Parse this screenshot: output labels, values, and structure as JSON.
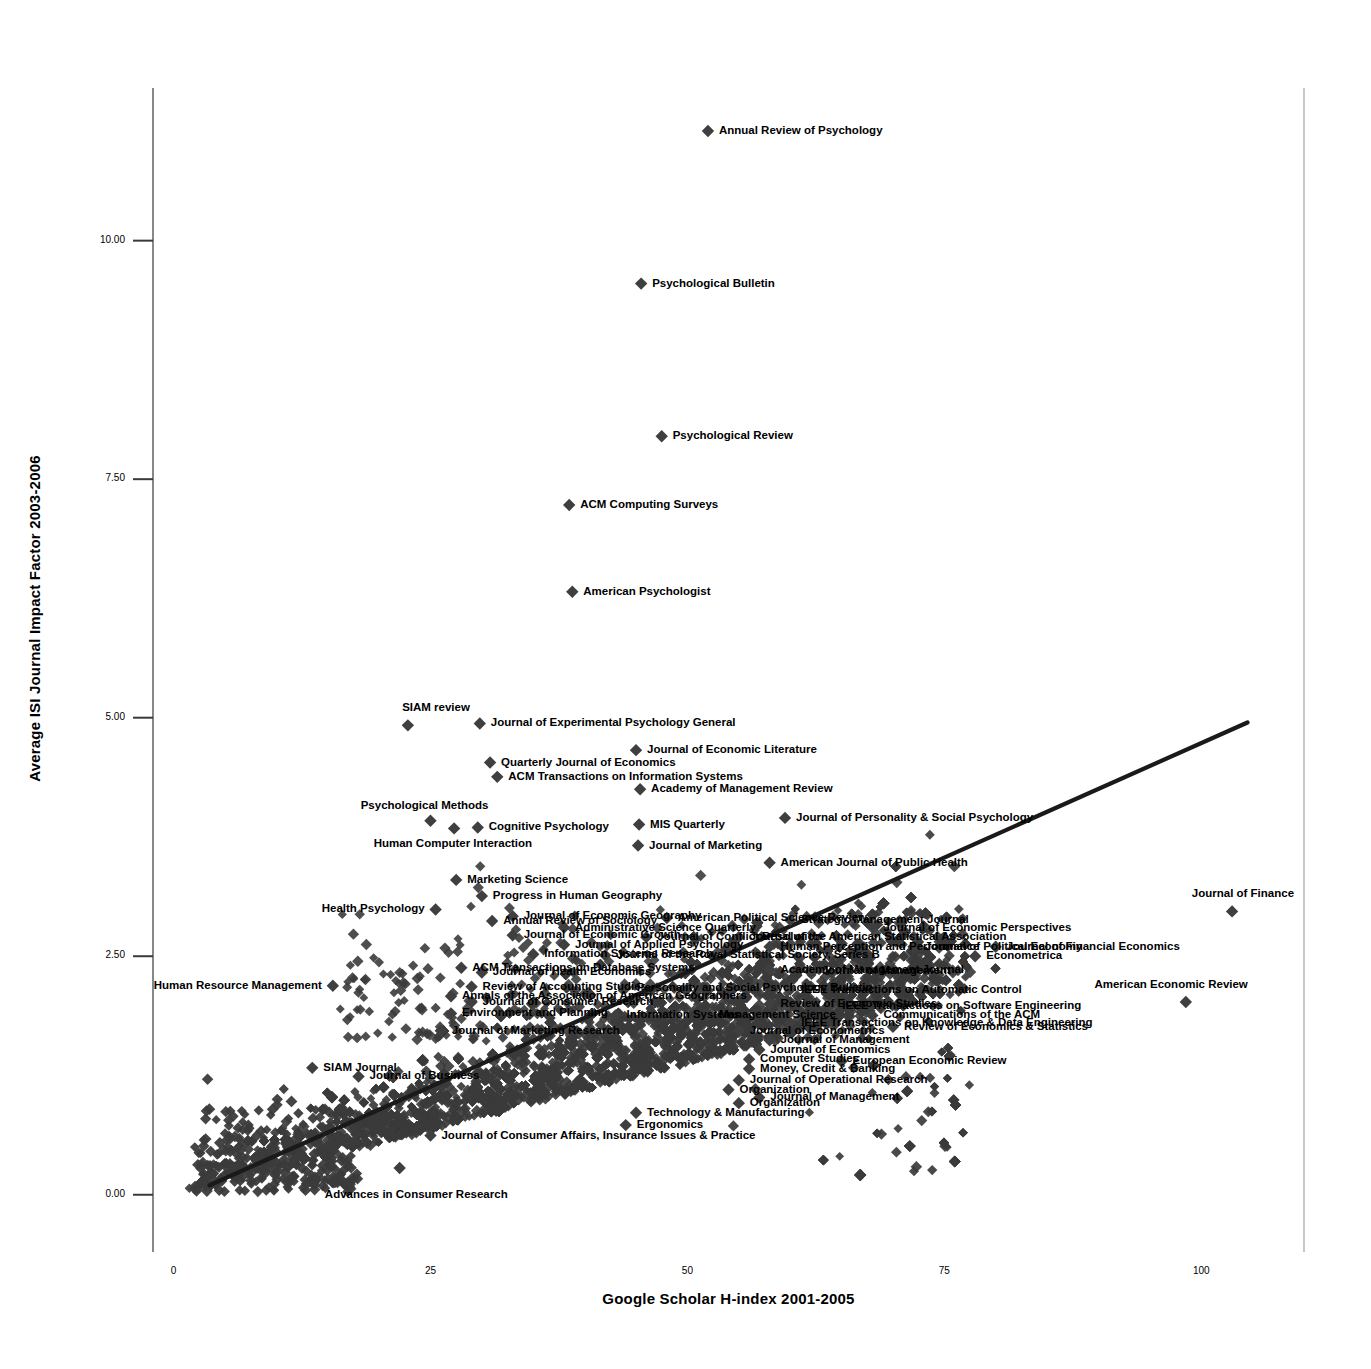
{
  "chart_data": {
    "type": "scatter",
    "title": "",
    "xlabel": "Google Scholar H-index 2001-2005",
    "ylabel": "Average ISI Journal Impact Factor 2003-2006",
    "xlim": [
      -2,
      110
    ],
    "ylim": [
      -0.6,
      11.6
    ],
    "xticks": [
      "0",
      "25",
      "50",
      "75",
      "100"
    ],
    "xtick_values": [
      0,
      25,
      50,
      75,
      100
    ],
    "yticks": [
      "0.00",
      "2.50",
      "5.00",
      "7.50",
      "10.00"
    ],
    "ytick_values": [
      0.0,
      2.5,
      5.0,
      7.5,
      10.0
    ],
    "grid": false,
    "legend": "none",
    "marker": "diamond",
    "marker_color": "#3f3f3f",
    "trendline": {
      "shown": true,
      "color": "#1a1a1a",
      "x_start": 3.5,
      "y_start": 0.1,
      "x_end": 104.5,
      "y_end": 4.95
    },
    "labeled_points": [
      {
        "label": "Annual Review of Psychology",
        "x": 52.0,
        "y": 11.15,
        "pos": "right"
      },
      {
        "label": "Psychological Bulletin",
        "x": 45.5,
        "y": 9.55,
        "pos": "right"
      },
      {
        "label": "Psychological Review",
        "x": 47.5,
        "y": 7.95,
        "pos": "right"
      },
      {
        "label": "ACM Computing Surveys",
        "x": 38.5,
        "y": 7.23,
        "pos": "right"
      },
      {
        "label": "American Psychologist",
        "x": 38.8,
        "y": 6.32,
        "pos": "right"
      },
      {
        "label": "SIAM review",
        "x": 22.8,
        "y": 4.92,
        "pos": "above"
      },
      {
        "label": "Journal of Experimental Psychology General",
        "x": 29.8,
        "y": 4.94,
        "pos": "right"
      },
      {
        "label": "Journal of Economic Literature",
        "x": 45.0,
        "y": 4.66,
        "pos": "right"
      },
      {
        "label": "Quarterly Journal of Economics",
        "x": 30.8,
        "y": 4.53,
        "pos": "right"
      },
      {
        "label": "ACM Transactions on Information Systems",
        "x": 31.5,
        "y": 4.38,
        "pos": "right"
      },
      {
        "label": "Academy of Management Review",
        "x": 45.4,
        "y": 4.25,
        "pos": "right"
      },
      {
        "label": "Psychological Methods",
        "x": 25.0,
        "y": 3.92,
        "pos": "above-left"
      },
      {
        "label": "Journal of Personality & Social Psychology",
        "x": 59.5,
        "y": 3.95,
        "pos": "right"
      },
      {
        "label": "Cognitive Psychology",
        "x": 29.6,
        "y": 3.85,
        "pos": "right"
      },
      {
        "label": "MIS Quarterly",
        "x": 45.3,
        "y": 3.88,
        "pos": "right"
      },
      {
        "label": "Human Computer Interaction",
        "x": 27.3,
        "y": 3.84,
        "pos": "below-left"
      },
      {
        "label": "Journal of Marketing",
        "x": 45.2,
        "y": 3.66,
        "pos": "right"
      },
      {
        "label": "American Journal of Public Health",
        "x": 58.0,
        "y": 3.48,
        "pos": "right"
      },
      {
        "label": "Marketing Science",
        "x": 27.5,
        "y": 3.3,
        "pos": "right"
      },
      {
        "label": "Progress in Human Geography",
        "x": 30.0,
        "y": 3.13,
        "pos": "right"
      },
      {
        "label": "Health Psychology",
        "x": 25.5,
        "y": 2.99,
        "pos": "left"
      },
      {
        "label": "Journal of Finance",
        "x": 103.0,
        "y": 2.97,
        "pos": "above"
      },
      {
        "label": "Journal of Economic Geography",
        "x": 33.0,
        "y": 2.92,
        "pos": "right"
      },
      {
        "label": "Annual Review of Sociology",
        "x": 31.0,
        "y": 2.87,
        "pos": "right"
      },
      {
        "label": "American Political Science Review",
        "x": 48.0,
        "y": 2.9,
        "pos": "right"
      },
      {
        "label": "Strategic Management Journal",
        "x": 60.0,
        "y": 2.88,
        "pos": "right"
      },
      {
        "label": "Administrative Science Quarterly",
        "x": 38.0,
        "y": 2.8,
        "pos": "right"
      },
      {
        "label": "Journal of Economic Perspectives",
        "x": 68.0,
        "y": 2.8,
        "pos": "right"
      },
      {
        "label": "Journal of Economic Growth",
        "x": 33.0,
        "y": 2.72,
        "pos": "right"
      },
      {
        "label": "Journal of Conflict Resolution",
        "x": 46.0,
        "y": 2.7,
        "pos": "right"
      },
      {
        "label": "Journal of the American Statistical Association",
        "x": 55.0,
        "y": 2.7,
        "pos": "right"
      },
      {
        "label": "Journal of Applied Psychology",
        "x": 38.0,
        "y": 2.62,
        "pos": "right"
      },
      {
        "label": "Human Perception and Performance",
        "x": 58.0,
        "y": 2.6,
        "pos": "right"
      },
      {
        "label": "Journal of Political Economy",
        "x": 72.0,
        "y": 2.6,
        "pos": "right"
      },
      {
        "label": "Journal of Financial Economics",
        "x": 80.0,
        "y": 2.6,
        "pos": "right"
      },
      {
        "label": "Journal of the Royal Statistical Society, Series B",
        "x": 42.0,
        "y": 2.51,
        "pos": "right"
      },
      {
        "label": "Information Systems Research",
        "x": 35.0,
        "y": 2.52,
        "pos": "right"
      },
      {
        "label": "Econometrica",
        "x": 78.0,
        "y": 2.5,
        "pos": "right"
      },
      {
        "label": "ACM Transactions on Database Systems",
        "x": 28.0,
        "y": 2.38,
        "pos": "right"
      },
      {
        "label": "Journal of Health Economics",
        "x": 30.0,
        "y": 2.33,
        "pos": "right"
      },
      {
        "label": "Academy of Management Journal",
        "x": 58.0,
        "y": 2.36,
        "pos": "right"
      },
      {
        "label": "Journal of Management",
        "x": 62.0,
        "y": 2.34,
        "pos": "right"
      },
      {
        "label": "Human Resource Management",
        "x": 15.5,
        "y": 2.19,
        "pos": "left"
      },
      {
        "label": "Review of Accounting Studies",
        "x": 29.0,
        "y": 2.18,
        "pos": "right"
      },
      {
        "label": "Personality and Social Psychology Bulletin",
        "x": 44.0,
        "y": 2.17,
        "pos": "right"
      },
      {
        "label": "IEEE Transactions on Automatic Control",
        "x": 60.0,
        "y": 2.15,
        "pos": "right"
      },
      {
        "label": "Annals of the Association of American Geographers",
        "x": 27.0,
        "y": 2.08,
        "pos": "right"
      },
      {
        "label": "American Economic Review",
        "x": 98.5,
        "y": 2.02,
        "pos": "above"
      },
      {
        "label": "Journal of Consumer Research",
        "x": 29.0,
        "y": 2.02,
        "pos": "right"
      },
      {
        "label": "Review of Economic Studies",
        "x": 58.0,
        "y": 2.0,
        "pos": "right"
      },
      {
        "label": "IEEE Transactions on Software Engineering",
        "x": 64.0,
        "y": 1.98,
        "pos": "right"
      },
      {
        "label": "Environment and Planning",
        "x": 27.0,
        "y": 1.9,
        "pos": "right"
      },
      {
        "label": "Information Systems",
        "x": 43.0,
        "y": 1.88,
        "pos": "right"
      },
      {
        "label": "Management Science",
        "x": 52.0,
        "y": 1.88,
        "pos": "right"
      },
      {
        "label": "Communications of the ACM",
        "x": 68.0,
        "y": 1.88,
        "pos": "right"
      },
      {
        "label": "IEEE Transactions on Knowledge & Data Engineering",
        "x": 60.0,
        "y": 1.8,
        "pos": "right"
      },
      {
        "label": "Review of Economics & Statistics",
        "x": 70.0,
        "y": 1.76,
        "pos": "right"
      },
      {
        "label": "Journal of Marketing Research",
        "x": 26.0,
        "y": 1.72,
        "pos": "right"
      },
      {
        "label": "Journal of Econometrics",
        "x": 55.0,
        "y": 1.72,
        "pos": "right"
      },
      {
        "label": "Journal of Management",
        "x": 58.0,
        "y": 1.62,
        "pos": "right"
      },
      {
        "label": "Journal of Economics",
        "x": 57.0,
        "y": 1.52,
        "pos": "right"
      },
      {
        "label": "Computer Studies",
        "x": 56.0,
        "y": 1.42,
        "pos": "right"
      },
      {
        "label": "European Economic Review",
        "x": 65.0,
        "y": 1.4,
        "pos": "right"
      },
      {
        "label": "SIAM Journal",
        "x": 13.5,
        "y": 1.33,
        "pos": "right"
      },
      {
        "label": "Money, Credit & Banking",
        "x": 56.0,
        "y": 1.32,
        "pos": "right"
      },
      {
        "label": "Journal of Business",
        "x": 18.0,
        "y": 1.24,
        "pos": "right"
      },
      {
        "label": "Journal of Operational Research",
        "x": 55.0,
        "y": 1.2,
        "pos": "right"
      },
      {
        "label": "Organization",
        "x": 54.0,
        "y": 1.1,
        "pos": "right"
      },
      {
        "label": "Journal of Management",
        "x": 57.0,
        "y": 1.02,
        "pos": "right"
      },
      {
        "label": "Organization",
        "x": 55.0,
        "y": 0.96,
        "pos": "right"
      },
      {
        "label": "Technology & Manufacturing",
        "x": 45.0,
        "y": 0.86,
        "pos": "right"
      },
      {
        "label": "Ergonomics",
        "x": 44.0,
        "y": 0.73,
        "pos": "right"
      },
      {
        "label": "Journal of Consumer Affairs, Insurance Issues & Practice",
        "x": 25.0,
        "y": 0.62,
        "pos": "right"
      },
      {
        "label": "Advances in Consumer Research",
        "x": 22.0,
        "y": 0.28,
        "pos": "below"
      }
    ],
    "cloud_description": "Dense cloud of several thousand journal markers rising from lower-left to upper-right, saturating to near-solid black between h-index 25 and 70 at impact factors 0.1 to 2.2."
  },
  "axes": {
    "y_axis_title": "Average ISI Journal Impact Factor 2003-2006",
    "x_axis_title": "Google Scholar H-index 2001-2005"
  },
  "colors": {
    "marker": "#3f3f3f",
    "axis": "#555555",
    "border": "#a8a8a8",
    "text": "#000000",
    "trendline": "#1a1a1a"
  }
}
